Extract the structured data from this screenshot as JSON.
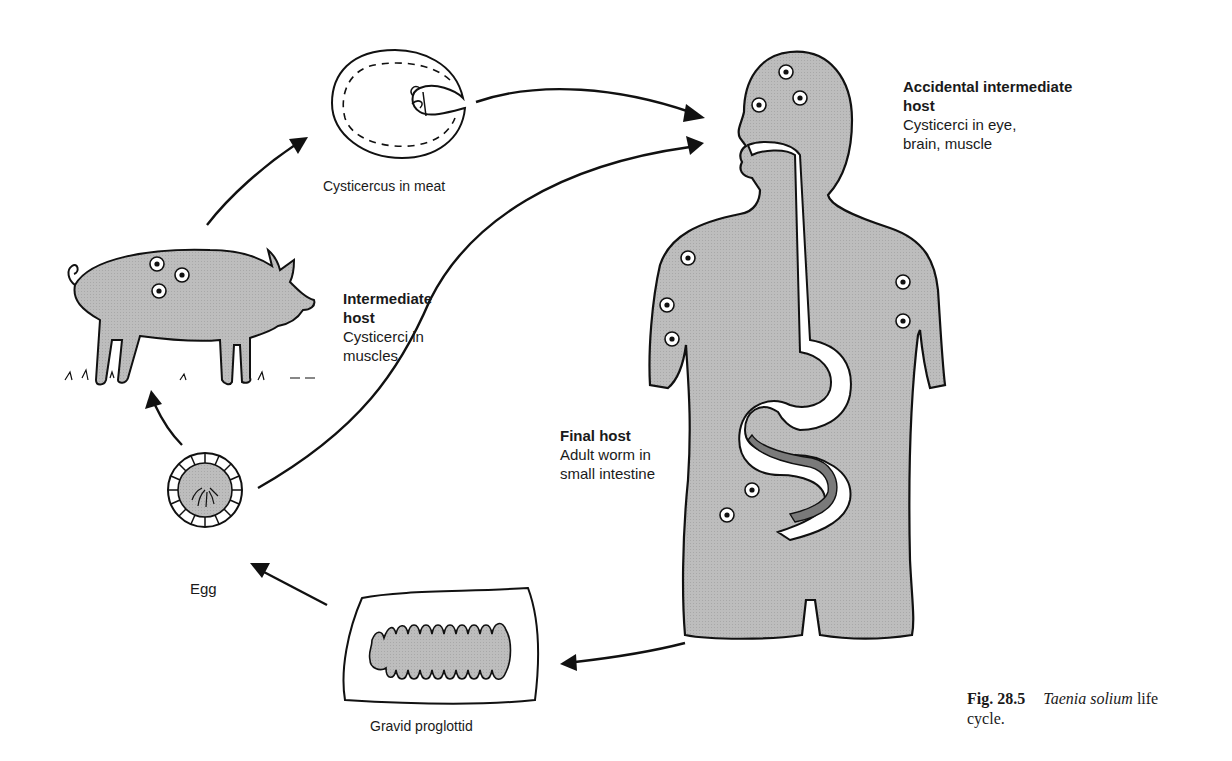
{
  "figure": {
    "number": "Fig. 28.5",
    "title_italic": "Taenia solium",
    "title_rest_line1": " life",
    "title_rest_line2": "cycle."
  },
  "stages": {
    "cysticercus": {
      "caption": "Cysticercus in meat"
    },
    "pig": {
      "heading_line1": "Intermediate",
      "heading_line2": "host",
      "desc_line1": "Cysticerci in",
      "desc_line2": "muscles"
    },
    "accidental_host": {
      "heading_line1": "Accidental intermediate",
      "heading_line2": "host",
      "desc_line1": "Cysticerci in eye,",
      "desc_line2": "brain, muscle"
    },
    "final_host": {
      "heading": "Final host",
      "desc_line1": "Adult worm in",
      "desc_line2": "small intestine"
    },
    "egg": {
      "caption": "Egg"
    },
    "proglottid": {
      "caption": "Gravid proglottid"
    }
  },
  "colors": {
    "fill_gray": "#b8b8b8",
    "stroke": "#111111",
    "background": "#ffffff",
    "worm": "#7a7a7a"
  },
  "arrows": [
    {
      "from": "pig",
      "to": "cysticercus"
    },
    {
      "from": "cysticercus",
      "to": "human-mouth"
    },
    {
      "from": "egg",
      "to": "human-mouth"
    },
    {
      "from": "human",
      "to": "proglottid"
    },
    {
      "from": "proglottid",
      "to": "egg"
    },
    {
      "from": "egg",
      "to": "pig"
    }
  ]
}
